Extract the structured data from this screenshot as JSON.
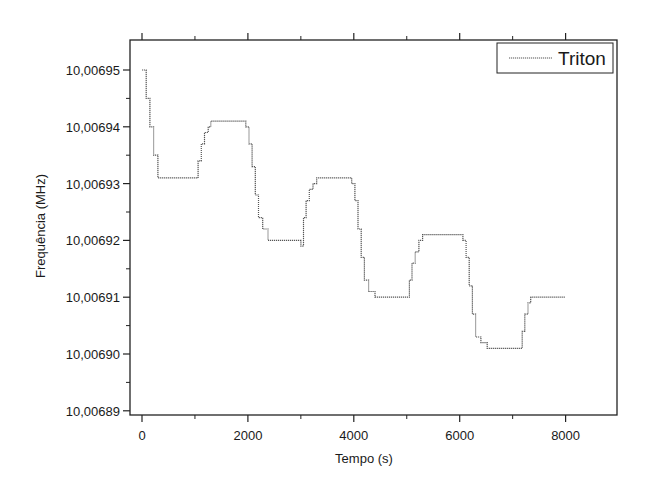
{
  "chart_data": {
    "type": "line",
    "title": "",
    "xlabel": "Tempo (s)",
    "ylabel": "Frequência (MHz)",
    "xlim": [
      -230,
      9000
    ],
    "ylim": [
      10.00689,
      10.006955
    ],
    "x_ticks": [
      0,
      2000,
      4000,
      6000,
      8000
    ],
    "x_tick_labels": [
      "0",
      "2000",
      "4000",
      "6000",
      "8000"
    ],
    "x_minor_ticks": [
      1000,
      3000,
      5000,
      7000
    ],
    "y_ticks": [
      10.00695,
      10.00694,
      10.00693,
      10.00692,
      10.00691,
      10.0069,
      10.00689
    ],
    "y_tick_labels": [
      "10,00695",
      "10,00694",
      "10,00693",
      "10,00692",
      "10,00691",
      "10,00690",
      "10,00689"
    ],
    "grid": false,
    "legend_position": "upper right",
    "series": [
      {
        "name": "Triton",
        "color": "#555555",
        "style": "dotted-step",
        "x": [
          0,
          80,
          150,
          220,
          300,
          1000,
          1060,
          1120,
          1180,
          1250,
          1300,
          1900,
          1960,
          2020,
          2080,
          2140,
          2200,
          2280,
          2380,
          2980,
          3000,
          3050,
          3100,
          3160,
          3230,
          3300,
          3900,
          3960,
          4020,
          4080,
          4140,
          4200,
          4280,
          4400,
          5000,
          5050,
          5100,
          5160,
          5230,
          5300,
          5400,
          6000,
          6060,
          6120,
          6180,
          6240,
          6300,
          6400,
          6520,
          7130,
          7180,
          7230,
          7290,
          7340,
          7400,
          8000
        ],
        "y": [
          10.00695,
          10.006945,
          10.00694,
          10.006935,
          10.006931,
          10.006931,
          10.006934,
          10.006937,
          10.006939,
          10.00694,
          10.006941,
          10.006941,
          10.00694,
          10.006937,
          10.006933,
          10.006928,
          10.006924,
          10.006922,
          10.00692,
          10.00692,
          10.006919,
          10.006924,
          10.006927,
          10.006929,
          10.00693,
          10.006931,
          10.006931,
          10.00693,
          10.006927,
          10.006922,
          10.006917,
          10.006913,
          10.006911,
          10.00691,
          10.00691,
          10.006913,
          10.006916,
          10.006918,
          10.00692,
          10.006921,
          10.006921,
          10.006921,
          10.00692,
          10.006917,
          10.006912,
          10.006907,
          10.006903,
          10.006902,
          10.006901,
          10.006901,
          10.006904,
          10.006907,
          10.006909,
          10.00691,
          10.00691,
          10.00691
        ]
      }
    ]
  },
  "legend": {
    "label": "Triton"
  }
}
